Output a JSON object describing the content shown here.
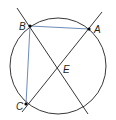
{
  "diagram": {
    "type": "geometry-circle-chords",
    "colors": {
      "circle": "#231f20",
      "lines": "#231f20",
      "segments": "#5b7fb0",
      "points": "#000000"
    },
    "circle": {
      "cx": 58,
      "cy": 66,
      "r": 48
    },
    "points": [
      {
        "id": "B",
        "label": "B",
        "x": 30,
        "y": 26,
        "lx": 18,
        "ly": 30
      },
      {
        "id": "A",
        "label": "A",
        "x": 89,
        "y": 29,
        "lx": 94,
        "ly": 33
      },
      {
        "id": "C",
        "label": "C",
        "x": 26,
        "y": 104,
        "lx": 15,
        "ly": 110
      },
      {
        "id": "E",
        "label": "E",
        "x": 58,
        "y": 68,
        "lx": 63,
        "ly": 72
      }
    ],
    "lines": [
      {
        "id": "line-BE",
        "x1": 17,
        "y1": 8,
        "x2": 88,
        "y2": 114
      },
      {
        "id": "line-CA",
        "x1": 22,
        "y1": 112,
        "x2": 102,
        "y2": 12
      }
    ],
    "segments": [
      {
        "id": "segment-BA",
        "from": "B",
        "to": "A"
      },
      {
        "id": "segment-BC",
        "from": "B",
        "to": "C"
      }
    ]
  }
}
